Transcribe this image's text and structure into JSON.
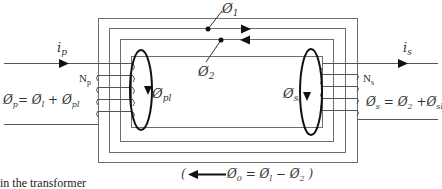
{
  "diagram": {
    "type": "transformer-flux-diagram",
    "labels": {
      "phi1": "Ø",
      "phi1_sub": "1",
      "phi2": "Ø",
      "phi2_sub": "2",
      "ip": "i",
      "ip_sub": "p",
      "is": "i",
      "is_sub": "s",
      "np": "N",
      "np_sub": "p",
      "ns": "N",
      "ns_sub": "s",
      "phi_pl": "Ø",
      "phi_pl_sub": "pl",
      "phi_sl": "Ø",
      "phi_sl_sub": "sl",
      "eq_primary": "Ø",
      "eq_primary_sub": "p",
      "eq_primary_rhs": "= Ø",
      "eq_primary_rhs_sub1": "l",
      "eq_primary_plus": " + Ø",
      "eq_primary_sub2": "pl",
      "eq_secondary": "Ø",
      "eq_secondary_sub": "s",
      "eq_secondary_rhs": " = Ø",
      "eq_secondary_sub1": "2",
      "eq_secondary_plus": " +Ø",
      "eq_secondary_sub2": "sl",
      "net_open": "(",
      "net_phi0": "Ø",
      "net_phi0_sub": "0",
      "net_eq": " = Ø",
      "net_sub1": "l",
      "net_minus": " − Ø",
      "net_sub2": "2",
      "net_close": " )"
    },
    "colors": {
      "frame": "#6e6e6e",
      "wire": "#555555",
      "loop": "#111111",
      "arrow": "#111111"
    }
  },
  "caption": {
    "text": "in the transformer"
  }
}
